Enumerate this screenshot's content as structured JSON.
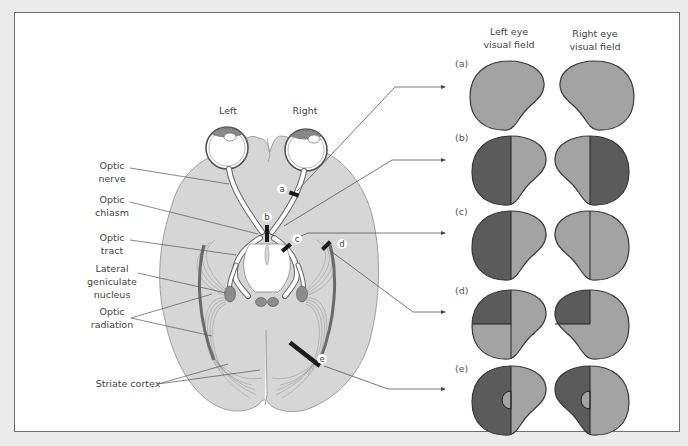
{
  "diagram": {
    "side_labels": {
      "left": "Left",
      "right": "Right"
    },
    "anatomy_labels": [
      {
        "id": "optic-nerve",
        "line1": "Optic",
        "line2": "nerve"
      },
      {
        "id": "optic-chiasm",
        "line1": "Optic",
        "line2": "chiasm"
      },
      {
        "id": "optic-tract",
        "line1": "Optic",
        "line2": "tract"
      },
      {
        "id": "lgn",
        "line1": "Lateral",
        "line2": "geniculate",
        "line3": "nucleus"
      },
      {
        "id": "optic-radiation",
        "line1": "Optic",
        "line2": "radiation"
      },
      {
        "id": "striate-cortex",
        "line1": "Striate cortex"
      }
    ],
    "lesion_points": [
      "a",
      "b",
      "c",
      "d",
      "e"
    ],
    "field_headers": {
      "left": {
        "line1": "Left eye",
        "line2": "visual field"
      },
      "right": {
        "line1": "Right eye",
        "line2": "visual field"
      }
    },
    "rows": [
      {
        "label": "(a)",
        "left": "intact",
        "right": "intact"
      },
      {
        "label": "(b)",
        "left": "temporal-half-loss",
        "right": "temporal-half-loss"
      },
      {
        "label": "(c)",
        "left": "left-half-loss",
        "right": "left-half-loss"
      },
      {
        "label": "(d)",
        "left": "upper-left-quadrant-loss",
        "right": "upper-left-quadrant-loss"
      },
      {
        "label": "(e)",
        "left": "left-half-loss-macular-sparing",
        "right": "left-half-loss-macular-sparing"
      }
    ],
    "colors": {
      "brain": "#d6d6d6",
      "field_seen": "#a3a3a3",
      "field_lost": "#5b5b5b",
      "outline": "#3a3a3a",
      "lesion": "#1a1a1a",
      "radiation": "#8a8a8a"
    }
  }
}
